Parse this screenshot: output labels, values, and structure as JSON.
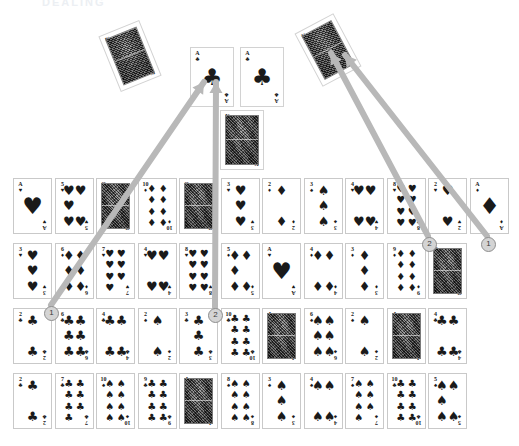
{
  "header": {
    "ghost_text": "DEALING"
  },
  "canvas": {
    "width": 519,
    "height": 446,
    "background": "#ffffff"
  },
  "colors": {
    "card_face": "#ffffff",
    "card_border": "#c9c9c9",
    "pip": "#1a1a1a",
    "arrow": "#b8b8b8",
    "step_fill": "#d4d4d4",
    "step_border": "#8e8e8e"
  },
  "loose_cards": [
    {
      "name": "king-of-diamonds-rotated",
      "rank": "K",
      "suit": "diamonds",
      "face": true,
      "x": 108,
      "y": 26,
      "rotation": -22
    },
    {
      "name": "ace-of-clubs-left",
      "rank": "A",
      "suit": "clubs",
      "face": false,
      "x": 190,
      "y": 47,
      "rotation": 0
    },
    {
      "name": "ace-of-clubs-right",
      "rank": "A",
      "suit": "clubs",
      "face": false,
      "x": 240,
      "y": 47,
      "rotation": 0
    },
    {
      "name": "king-of-hearts",
      "rank": "K",
      "suit": "hearts",
      "face": true,
      "x": 220,
      "y": 110,
      "rotation": 0
    },
    {
      "name": "king-of-diamonds-top-right",
      "rank": "K",
      "suit": "diamonds",
      "face": true,
      "x": 306,
      "y": 20,
      "rotation": -28
    }
  ],
  "steps": [
    {
      "label": "1",
      "x": 44,
      "y": 306
    },
    {
      "label": "2",
      "x": 208,
      "y": 308
    },
    {
      "label": "2",
      "x": 422,
      "y": 237
    },
    {
      "label": "1",
      "x": 481,
      "y": 237
    }
  ],
  "arrows": [
    {
      "name": "arrow-step-1-left",
      "from_x": 51,
      "from_y": 305,
      "to_x": 204,
      "to_y": 82
    },
    {
      "name": "arrow-step-2-left",
      "from_x": 215,
      "from_y": 307,
      "to_x": 216,
      "to_y": 82
    },
    {
      "name": "arrow-step-2-right",
      "from_x": 428,
      "from_y": 236,
      "to_x": 331,
      "to_y": 53
    },
    {
      "name": "arrow-step-1-right",
      "from_x": 487,
      "from_y": 236,
      "to_x": 345,
      "to_y": 55
    }
  ],
  "grid": {
    "origin_x": 13,
    "origin_y": 178,
    "col_step": 41.5,
    "row_step": 65,
    "columns": 12,
    "rows": [
      {
        "row_name": "row-1",
        "cards": [
          {
            "rank": "A",
            "suit": "hearts",
            "face": false
          },
          {
            "rank": "5",
            "suit": "hearts",
            "face": false
          },
          {
            "rank": "Q",
            "suit": "diamonds",
            "face": true
          },
          {
            "rank": "10",
            "suit": "diamonds",
            "face": false
          },
          {
            "rank": "Q",
            "suit": "spades",
            "face": true
          },
          {
            "rank": "3",
            "suit": "hearts",
            "face": false
          },
          {
            "rank": "2",
            "suit": "diamonds",
            "face": false
          },
          {
            "rank": "3",
            "suit": "spades",
            "face": false
          },
          {
            "rank": "4",
            "suit": "hearts",
            "face": false
          },
          {
            "rank": "8",
            "suit": "hearts",
            "face": false
          },
          {
            "rank": "2",
            "suit": "hearts",
            "face": false
          },
          {
            "rank": "A",
            "suit": "diamonds",
            "face": false
          }
        ]
      },
      {
        "row_name": "row-2",
        "cards": [
          {
            "rank": "3",
            "suit": "hearts",
            "face": false
          },
          {
            "rank": "6",
            "suit": "diamonds",
            "face": false
          },
          {
            "rank": "7",
            "suit": "hearts",
            "face": false
          },
          {
            "rank": "4",
            "suit": "hearts",
            "face": false
          },
          {
            "rank": "8",
            "suit": "hearts",
            "face": false
          },
          {
            "rank": "5",
            "suit": "diamonds",
            "face": false
          },
          {
            "rank": "A",
            "suit": "hearts",
            "face": false
          },
          {
            "rank": "4",
            "suit": "diamonds",
            "face": false
          },
          {
            "rank": "3",
            "suit": "diamonds",
            "face": false
          },
          {
            "rank": "9",
            "suit": "diamonds",
            "face": false
          },
          {
            "rank": "Q",
            "suit": "diamonds",
            "face": true
          }
        ]
      },
      {
        "row_name": "row-3",
        "cards": [
          {
            "rank": "2",
            "suit": "clubs",
            "face": false
          },
          {
            "rank": "6",
            "suit": "clubs",
            "face": false
          },
          {
            "rank": "4",
            "suit": "clubs",
            "face": false
          },
          {
            "rank": "2",
            "suit": "spades",
            "face": false
          },
          {
            "rank": "3",
            "suit": "clubs",
            "face": false
          },
          {
            "rank": "10",
            "suit": "clubs",
            "face": false
          },
          {
            "rank": "J",
            "suit": "spades",
            "face": true
          },
          {
            "rank": "6",
            "suit": "spades",
            "face": false
          },
          {
            "rank": "2",
            "suit": "spades",
            "face": false
          },
          {
            "rank": "J",
            "suit": "spades",
            "face": true
          },
          {
            "rank": "4",
            "suit": "clubs",
            "face": false
          }
        ]
      },
      {
        "row_name": "row-4",
        "cards": [
          {
            "rank": "2",
            "suit": "clubs",
            "face": false
          },
          {
            "rank": "7",
            "suit": "clubs",
            "face": false
          },
          {
            "rank": "10",
            "suit": "spades",
            "face": false
          },
          {
            "rank": "9",
            "suit": "clubs",
            "face": false
          },
          {
            "rank": "J",
            "suit": "clubs",
            "face": true
          },
          {
            "rank": "8",
            "suit": "spades",
            "face": false
          },
          {
            "rank": "3",
            "suit": "spades",
            "face": false
          },
          {
            "rank": "4",
            "suit": "spades",
            "face": false
          },
          {
            "rank": "7",
            "suit": "spades",
            "face": false
          },
          {
            "rank": "10",
            "suit": "clubs",
            "face": false
          },
          {
            "rank": "5",
            "suit": "spades",
            "face": false
          }
        ]
      }
    ]
  }
}
